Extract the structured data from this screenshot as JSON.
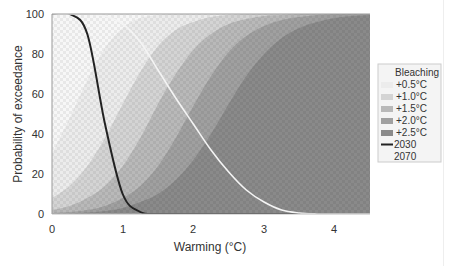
{
  "chart_data": {
    "type": "area",
    "title": "",
    "xlabel": "Warming (°C)",
    "ylabel": "Probability of exceedance",
    "xlim": [
      0,
      4.5
    ],
    "ylim": [
      0,
      100
    ],
    "xticks": [
      0,
      1,
      2,
      3,
      4
    ],
    "yticks": [
      0,
      20,
      40,
      60,
      80,
      100
    ],
    "grid": false,
    "legend_position": "right",
    "legend_title": "Bleaching",
    "x": [
      0,
      0.25,
      0.5,
      0.75,
      1.0,
      1.25,
      1.5,
      1.75,
      2.0,
      2.25,
      2.5,
      2.75,
      3.0,
      3.25,
      3.5,
      3.75,
      4.0,
      4.25,
      4.5
    ],
    "series": [
      {
        "name": "+0.5°C",
        "kind": "band",
        "color": "#ececec",
        "values": [
          30,
          48,
          67,
          83,
          93,
          98,
          99.5,
          100,
          100,
          100,
          100,
          100,
          100,
          100,
          100,
          100,
          100,
          100,
          100
        ]
      },
      {
        "name": "+1.0°C",
        "kind": "band",
        "color": "#d4d4d4",
        "values": [
          8,
          14,
          24,
          38,
          55,
          71,
          84,
          92,
          96,
          98.5,
          99.5,
          100,
          100,
          100,
          100,
          100,
          100,
          100,
          100
        ]
      },
      {
        "name": "+1.5°C",
        "kind": "band",
        "color": "#b9b9b9",
        "values": [
          2,
          4,
          8,
          14,
          24,
          38,
          55,
          70,
          82,
          90,
          95,
          97.5,
          99,
          99.5,
          100,
          100,
          100,
          100,
          100
        ]
      },
      {
        "name": "+2.0°C",
        "kind": "band",
        "color": "#a0a0a0",
        "values": [
          0.5,
          1,
          2,
          4,
          8,
          14,
          24,
          38,
          54,
          69,
          81,
          89,
          94,
          97,
          98.5,
          99.5,
          100,
          100,
          100
        ]
      },
      {
        "name": "+2.5°C",
        "kind": "band",
        "color": "#8a8a8a",
        "values": [
          0,
          0.3,
          0.7,
          1.5,
          3,
          6,
          10,
          17,
          27,
          40,
          55,
          69,
          80,
          88,
          93,
          96,
          98,
          99,
          99.5
        ]
      },
      {
        "name": "2030",
        "kind": "line",
        "color": "#222222",
        "values": [
          100,
          100,
          90,
          45,
          10,
          1,
          0,
          0,
          0,
          0,
          0,
          0,
          0,
          0,
          0,
          0,
          0,
          0,
          0
        ]
      },
      {
        "name": "2070",
        "kind": "line",
        "color": "#f4f4f4",
        "values": [
          100,
          100,
          100,
          99,
          95,
          86,
          72,
          58,
          45,
          32,
          21,
          12,
          6,
          2,
          0.5,
          0,
          0,
          0,
          0
        ]
      }
    ]
  },
  "axes": {
    "xlabel": "Warming (°C)",
    "ylabel": "Probability of exceedance",
    "xtick_labels": [
      "0",
      "1",
      "2",
      "3",
      "4"
    ],
    "ytick_labels": [
      "0",
      "20",
      "40",
      "60",
      "80",
      "100"
    ]
  },
  "legend": {
    "title": "Bleaching",
    "items": [
      {
        "label": "+0.5°C",
        "swatch": "fill",
        "color": "#ececec"
      },
      {
        "label": "+1.0°C",
        "swatch": "fill",
        "color": "#d4d4d4"
      },
      {
        "label": "+1.5°C",
        "swatch": "fill",
        "color": "#b9b9b9"
      },
      {
        "label": "+2.0°C",
        "swatch": "fill",
        "color": "#a0a0a0"
      },
      {
        "label": "+2.5°C",
        "swatch": "fill",
        "color": "#8a8a8a"
      },
      {
        "label": "2030",
        "swatch": "line",
        "color": "#222222"
      },
      {
        "label": "2070",
        "swatch": "line",
        "color": "#f4f4f4"
      }
    ]
  }
}
